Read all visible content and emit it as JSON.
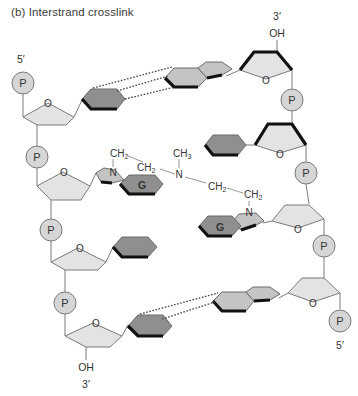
{
  "figure": {
    "title": "(b) Interstrand crosslink"
  },
  "colors": {
    "sugar_fill": "#e3e3e3",
    "phosphate_fill": "#d6d6d6",
    "base_dark_fill": "#8f8f8f",
    "base_light_fill": "#c4c4c4",
    "outline": "#7a7a7a",
    "edge_bold": "#111111",
    "text": "#333333"
  },
  "left_strand": {
    "top_label": "5′",
    "bottom_oh": "OH",
    "bottom_label": "3′",
    "phosphate_label": "P",
    "guanine_label": "G"
  },
  "right_strand": {
    "top_label": "3′",
    "top_oh": "OH",
    "bottom_label": "5′",
    "phosphate_label": "P",
    "guanine_label": "G"
  },
  "sugar_ring_atom": "O",
  "crosslink": {
    "left_n": "N",
    "left_ch2_a": "CH",
    "left_ch2_b": "CH",
    "center_n": "N",
    "center_ch3": "CH",
    "right_ch2_a": "CH",
    "right_ch2_b": "CH",
    "right_n": "N",
    "sub_2": "2",
    "sub_3": "3"
  }
}
